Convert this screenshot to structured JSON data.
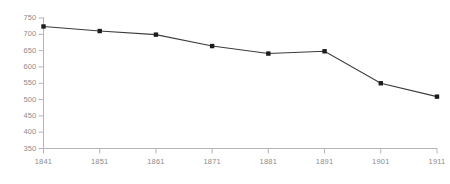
{
  "chart_data": {
    "type": "line",
    "title": "",
    "subtitle": "",
    "xlabel": "",
    "ylabel": "",
    "x": [
      1841,
      1851,
      1861,
      1871,
      1881,
      1891,
      1901,
      1911
    ],
    "categories": [
      "1841",
      "1851",
      "1861",
      "1871",
      "1881",
      "1891",
      "1901",
      "1911"
    ],
    "values": [
      724,
      710,
      699,
      664,
      641,
      648,
      550,
      509
    ],
    "series": [
      {
        "name": "Population",
        "values": [
          724,
          710,
          699,
          664,
          641,
          648,
          550,
          509
        ]
      }
    ],
    "xlim": [
      1841,
      1911
    ],
    "ylim": [
      350,
      750
    ],
    "y_ticks": [
      350,
      400,
      450,
      500,
      550,
      600,
      650,
      700,
      750
    ],
    "y_tick_labels": [
      "350",
      "400",
      "450",
      "500",
      "550",
      "600",
      "650",
      "700",
      "750"
    ],
    "x_ticks": [
      1841,
      1851,
      1861,
      1871,
      1881,
      1891,
      1901,
      1911
    ],
    "x_tick_labels": [
      "1841",
      "1851",
      "1861",
      "1871",
      "1881",
      "1891",
      "1901",
      "1911"
    ],
    "grid": false,
    "legend": false,
    "legend_position": "none",
    "marker": "square",
    "line_color": "#3b3b3b",
    "marker_color": "#1c1c1c",
    "axis_color": "#b5b5b5",
    "tick_label_color": "#8c8c8c",
    "background_color": "#ffffff",
    "annotations": []
  }
}
